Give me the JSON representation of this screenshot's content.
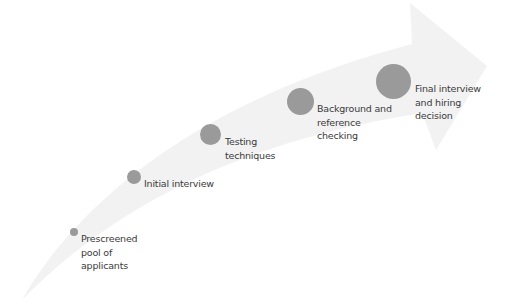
{
  "diagram": {
    "type": "process-arrow",
    "colors": {
      "arrow": "#f2f2f2",
      "dot": "#9a9a9a",
      "text": "#3a3a3a"
    },
    "steps": [
      {
        "lines": [
          "Prescreened",
          "pool of",
          "applicants"
        ]
      },
      {
        "lines": [
          "Initial interview"
        ]
      },
      {
        "lines": [
          "Testing",
          "techniques"
        ]
      },
      {
        "lines": [
          "Background and",
          "reference",
          "checking"
        ]
      },
      {
        "lines": [
          "Final interview",
          "and hiring",
          "decision"
        ]
      }
    ]
  }
}
